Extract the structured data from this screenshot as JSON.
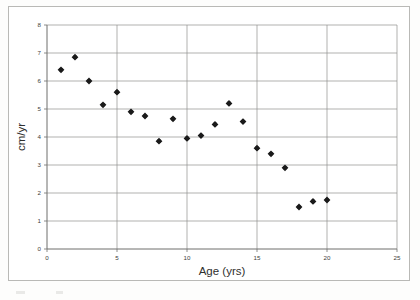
{
  "chart_data": {
    "type": "scatter",
    "title": "",
    "xlabel": "Age (yrs)",
    "ylabel": "cm/yr",
    "xlim": [
      0,
      25
    ],
    "ylim": [
      0,
      8
    ],
    "xticks": [
      "0",
      "5",
      "10",
      "15",
      "20",
      "25"
    ],
    "xtick_values": [
      0,
      5,
      10,
      15,
      20,
      25
    ],
    "yticks": [
      "0",
      "1",
      "2",
      "3",
      "4",
      "5",
      "6",
      "7",
      "8"
    ],
    "ytick_values": [
      0,
      1,
      2,
      3,
      4,
      5,
      6,
      7,
      8
    ],
    "grid": "horizontal-and-vertical",
    "legend": "none",
    "series": [
      {
        "name": "growth-rate",
        "x": [
          1,
          2,
          3,
          4,
          5,
          6,
          7,
          8,
          9,
          10,
          11,
          12,
          13,
          14,
          15,
          16,
          17,
          18,
          19,
          20
        ],
        "y": [
          6.4,
          6.85,
          6.0,
          5.15,
          5.6,
          4.9,
          4.75,
          3.85,
          4.65,
          3.95,
          4.05,
          4.45,
          5.2,
          4.55,
          3.6,
          3.4,
          2.9,
          1.5,
          1.7,
          1.75
        ]
      }
    ],
    "marker": {
      "shape": "diamond-dot",
      "color": "#1a1a1a",
      "size": 3.4
    }
  },
  "colors": {
    "background": "#ffffff",
    "frame_border": "#b9b9b6",
    "gridline": "#8f8f8c",
    "axis": "#6f6f6c",
    "text": "#3d3d3b",
    "marker": "#1a1a1a"
  }
}
